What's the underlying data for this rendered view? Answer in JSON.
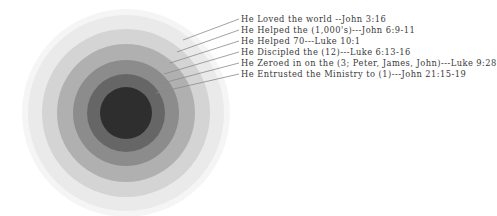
{
  "diagram": {
    "center": {
      "x": 126,
      "y": 113
    },
    "rings": [
      {
        "radius": 104,
        "color": "#f5f5f5"
      },
      {
        "radius": 98,
        "color": "#eaeaea"
      },
      {
        "radius": 84,
        "color": "#d4d4d4"
      },
      {
        "radius": 69,
        "color": "#b0b0b0"
      },
      {
        "radius": 53,
        "color": "#8c8c8c"
      },
      {
        "radius": 39,
        "color": "#666666"
      },
      {
        "radius": 26,
        "color": "#2f2f2f"
      }
    ],
    "leader_color": "#8a8a8a",
    "labels": [
      {
        "text": "He Loved the world  --John 3:16",
        "y": 14,
        "line": {
          "x1": 239,
          "y1": 19,
          "x2": 183,
          "y2": 40
        }
      },
      {
        "text": "He Helped the (1,000's)---John 6:9-11",
        "y": 25,
        "line": {
          "x1": 239,
          "y1": 30,
          "x2": 177,
          "y2": 52
        }
      },
      {
        "text": "He Helped 70---Luke 10:1",
        "y": 36,
        "line": {
          "x1": 239,
          "y1": 41,
          "x2": 170,
          "y2": 63
        }
      },
      {
        "text": "He Discipled the (12)---Luke 6:13-16",
        "y": 47,
        "line": {
          "x1": 239,
          "y1": 52,
          "x2": 164,
          "y2": 74
        }
      },
      {
        "text": "He Zeroed in on the (3; Peter, James, John)---Luke 9:28",
        "y": 58,
        "line": {
          "x1": 239,
          "y1": 63,
          "x2": 159,
          "y2": 84
        }
      },
      {
        "text": "He Entrusted the Ministry to (1)---John 21:15-19",
        "y": 69,
        "line": {
          "x1": 239,
          "y1": 74,
          "x2": 156,
          "y2": 93
        }
      }
    ]
  }
}
